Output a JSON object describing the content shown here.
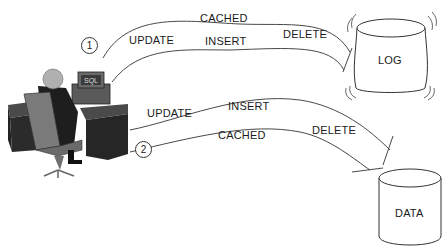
{
  "diagram": {
    "actor": {
      "label": "SQL",
      "description": "user at desk with computer"
    },
    "flows": [
      {
        "number": "1",
        "target": "LOG",
        "labels": {
          "update": "UPDATE",
          "cached": "CACHED",
          "insert": "INSERT",
          "delete": "DELETE"
        }
      },
      {
        "number": "2",
        "target": "DATA",
        "labels": {
          "update": "UPDATE",
          "insert": "INSERT",
          "cached": "CACHED",
          "delete": "DELETE"
        }
      }
    ],
    "stores": {
      "log": {
        "label": "LOG"
      },
      "data": {
        "label": "DATA"
      }
    },
    "colors": {
      "line": "#333333",
      "desk": "#2a2a2a",
      "chair": "#7a7a7a",
      "head": "#b0b0b0"
    }
  }
}
